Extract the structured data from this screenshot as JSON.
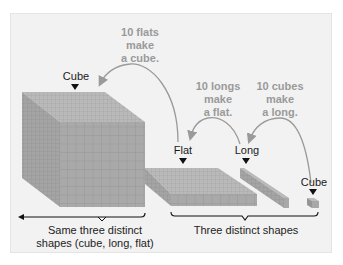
{
  "diagram": {
    "labels": {
      "cube_large": "Cube",
      "flat": "Flat",
      "long": "Long",
      "cube_small": "Cube"
    },
    "notes": {
      "flats_to_cube": [
        "10 flats",
        "make",
        "a cube."
      ],
      "longs_to_flat": [
        "10 longs",
        "make",
        "a flat."
      ],
      "cubes_to_long": [
        "10 cubes",
        "make",
        "a long."
      ]
    },
    "captions": {
      "left": [
        "Same three distinct",
        "shapes (cube, long, flat)"
      ],
      "right": "Three distinct shapes"
    },
    "colors": {
      "block_front": "#a8a8a8",
      "block_top": "#bdbdbd",
      "block_side": "#969696",
      "grid": "#8a8a8a",
      "arrow": "#9a9a9a",
      "note_text": "#9a9a9a",
      "panel": "#f2f2f2"
    }
  }
}
